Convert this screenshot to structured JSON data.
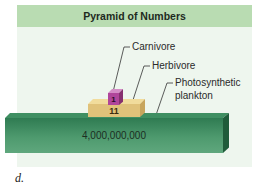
{
  "panel": {
    "title": "Pyramid of Numbers"
  },
  "levels": [
    {
      "name": "Carnivore",
      "count": "1",
      "color": "#b0459a"
    },
    {
      "name": "Herbivore",
      "count": "11",
      "color": "#e0c27a"
    },
    {
      "name": "Photosynthetic plankton",
      "name_line1": "Photosynthetic",
      "name_line2": "plankton",
      "count": "4,000,000,000",
      "color": "#3f8f62"
    }
  ],
  "colors": {
    "header_bg": "#b9dcb2",
    "panel_bg": "#eef6ee"
  },
  "caption": "d."
}
